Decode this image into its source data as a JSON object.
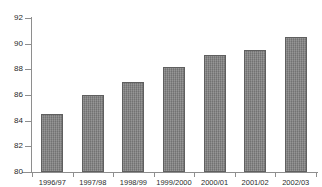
{
  "chart_data": {
    "type": "bar",
    "title": "",
    "subtitle": "",
    "xlabel": "",
    "ylabel": "",
    "categories": [
      "1996/97",
      "1997/98",
      "1998/99",
      "1999/2000",
      "2000/01",
      "2001/02",
      "2002/03"
    ],
    "values": [
      84.5,
      86.0,
      87.0,
      88.2,
      89.1,
      89.5,
      90.5
    ],
    "ylim": [
      80,
      92
    ],
    "ytick_values": [
      80,
      82,
      84,
      86,
      88,
      90,
      92
    ],
    "ytick_labels": [
      "80",
      "82",
      "84",
      "86",
      "88",
      "90",
      "92"
    ],
    "grid": false,
    "legend": null,
    "series": [
      {
        "name": "",
        "values": [
          84.5,
          86.0,
          87.0,
          88.2,
          89.1,
          89.5,
          90.5
        ]
      }
    ],
    "colors": {
      "bar_fill": "#7d7d7d",
      "bar_edge": "#5f5f5f",
      "axis": "#8e8e8e",
      "text": "#2b2b2b",
      "background": "#ffffff"
    }
  }
}
